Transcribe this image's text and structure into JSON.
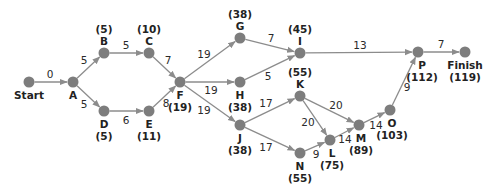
{
  "colors": {
    "node": "#7d7d7d",
    "edge": "#8c8c8c",
    "text": "#222222"
  },
  "nodes": [
    {
      "id": "Start",
      "x": 29,
      "y": 82,
      "name": "Start",
      "time": "",
      "name_pos": [
        29,
        99
      ],
      "time_pos": null
    },
    {
      "id": "A",
      "x": 73,
      "y": 82,
      "name": "A",
      "time": "",
      "name_pos": [
        73,
        99
      ],
      "time_pos": null
    },
    {
      "id": "B",
      "x": 104,
      "y": 53,
      "name": "B",
      "time": "(5)",
      "name_pos": [
        104,
        45
      ],
      "time_pos": [
        104,
        33
      ]
    },
    {
      "id": "C",
      "x": 149,
      "y": 53,
      "name": "C",
      "time": "(10)",
      "name_pos": [
        149,
        45
      ],
      "time_pos": [
        149,
        33
      ]
    },
    {
      "id": "D",
      "x": 104,
      "y": 111,
      "name": "D",
      "time": "(5)",
      "name_pos": [
        104,
        128
      ],
      "time_pos": [
        104,
        140
      ]
    },
    {
      "id": "E",
      "x": 149,
      "y": 111,
      "name": "E",
      "time": "(11)",
      "name_pos": [
        149,
        128
      ],
      "time_pos": [
        149,
        140
      ]
    },
    {
      "id": "F",
      "x": 180,
      "y": 82,
      "name": "F",
      "time": "(19)",
      "name_pos": [
        180,
        99
      ],
      "time_pos": [
        180,
        111
      ]
    },
    {
      "id": "G",
      "x": 240,
      "y": 38,
      "name": "G",
      "time": "(38)",
      "name_pos": [
        240,
        30
      ],
      "time_pos": [
        240,
        18
      ]
    },
    {
      "id": "H",
      "x": 240,
      "y": 82,
      "name": "H",
      "time": "(38)",
      "name_pos": [
        240,
        99
      ],
      "time_pos": [
        240,
        111
      ]
    },
    {
      "id": "I",
      "x": 300,
      "y": 53,
      "name": "I",
      "time": "(45)",
      "name_pos": [
        300,
        45
      ],
      "time_pos": [
        300,
        33
      ]
    },
    {
      "id": "J",
      "x": 240,
      "y": 125,
      "name": "J",
      "time": "(38)",
      "name_pos": [
        240,
        142
      ],
      "time_pos": [
        240,
        154
      ]
    },
    {
      "id": "K",
      "x": 300,
      "y": 96,
      "name": "K",
      "time": "(55)",
      "name_pos": [
        300,
        88
      ],
      "time_pos": [
        300,
        76
      ]
    },
    {
      "id": "N",
      "x": 300,
      "y": 153,
      "name": "N",
      "time": "(55)",
      "name_pos": [
        300,
        170
      ],
      "time_pos": [
        300,
        182
      ]
    },
    {
      "id": "L",
      "x": 330,
      "y": 140,
      "name": "L",
      "time": "(75)",
      "name_pos": [
        332,
        157
      ],
      "time_pos": [
        332,
        169
      ]
    },
    {
      "id": "M",
      "x": 359,
      "y": 125,
      "name": "M",
      "time": "(89)",
      "name_pos": [
        361,
        142
      ],
      "time_pos": [
        361,
        154
      ]
    },
    {
      "id": "O",
      "x": 390,
      "y": 110,
      "name": "O",
      "time": "(103)",
      "name_pos": [
        392,
        127
      ],
      "time_pos": [
        392,
        139
      ]
    },
    {
      "id": "P",
      "x": 418,
      "y": 52,
      "name": "P",
      "time": "(112)",
      "name_pos": [
        422,
        69
      ],
      "time_pos": [
        422,
        81
      ]
    },
    {
      "id": "Finish",
      "x": 465,
      "y": 52,
      "name": "Finish",
      "time": "(119)",
      "name_pos": [
        465,
        69
      ],
      "time_pos": [
        465,
        81
      ]
    }
  ],
  "edges": [
    {
      "from": "Start",
      "to": "A",
      "weight": "0",
      "lx": 50,
      "ly": 78
    },
    {
      "from": "A",
      "to": "B",
      "weight": "5",
      "lx": 84,
      "ly": 64
    },
    {
      "from": "A",
      "to": "D",
      "weight": "5",
      "lx": 84,
      "ly": 108
    },
    {
      "from": "B",
      "to": "C",
      "weight": "5",
      "lx": 126,
      "ly": 49
    },
    {
      "from": "D",
      "to": "E",
      "weight": "6",
      "lx": 126,
      "ly": 124
    },
    {
      "from": "C",
      "to": "F",
      "weight": "7",
      "lx": 168,
      "ly": 64
    },
    {
      "from": "E",
      "to": "F",
      "weight": "8",
      "lx": 166,
      "ly": 107
    },
    {
      "from": "F",
      "to": "G",
      "weight": "19",
      "lx": 204,
      "ly": 58
    },
    {
      "from": "F",
      "to": "H",
      "weight": "19",
      "lx": 211,
      "ly": 94
    },
    {
      "from": "F",
      "to": "J",
      "weight": "19",
      "lx": 204,
      "ly": 114
    },
    {
      "from": "G",
      "to": "I",
      "weight": "7",
      "lx": 271,
      "ly": 42
    },
    {
      "from": "H",
      "to": "I",
      "weight": "5",
      "lx": 268,
      "ly": 80
    },
    {
      "from": "I",
      "to": "P",
      "weight": "13",
      "lx": 360,
      "ly": 49
    },
    {
      "from": "P",
      "to": "Finish",
      "weight": "7",
      "lx": 441,
      "ly": 48
    },
    {
      "from": "J",
      "to": "K",
      "weight": "17",
      "lx": 266,
      "ly": 107
    },
    {
      "from": "J",
      "to": "N",
      "weight": "17",
      "lx": 266,
      "ly": 151
    },
    {
      "from": "K",
      "to": "M",
      "weight": "20",
      "lx": 336,
      "ly": 109
    },
    {
      "from": "K",
      "to": "L",
      "weight": "20",
      "lx": 308,
      "ly": 126
    },
    {
      "from": "N",
      "to": "L",
      "weight": "9",
      "lx": 316,
      "ly": 158
    },
    {
      "from": "L",
      "to": "M",
      "weight": "14",
      "lx": 345,
      "ly": 143
    },
    {
      "from": "M",
      "to": "O",
      "weight": "14",
      "lx": 376,
      "ly": 129
    },
    {
      "from": "O",
      "to": "P",
      "weight": "9",
      "lx": 407,
      "ly": 91
    }
  ]
}
